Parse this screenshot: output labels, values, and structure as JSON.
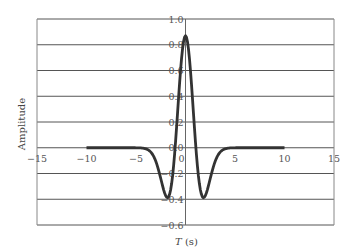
{
  "chart_data": {
    "type": "line",
    "title": "",
    "xlabel": "T (s)",
    "ylabel": "Amplitude",
    "xlim": [
      -15,
      15
    ],
    "ylim": [
      -0.6,
      1.0
    ],
    "grid": {
      "horizontal": true,
      "vertical": false
    },
    "legend": "none",
    "x_ticks": [
      "-15",
      "-10",
      "-5",
      "0",
      "5",
      "10",
      "15"
    ],
    "y_ticks": [
      "1.0",
      "0.8",
      "0.6",
      "0.4",
      "0.2",
      "0.0",
      "-0.2",
      "-0.4",
      "-0.6"
    ],
    "series": [
      {
        "name": "wavelet",
        "color": "#333333",
        "x": [
          -10,
          -6,
          -5,
          -4,
          -3.5,
          -3,
          -2.5,
          -2,
          -1.8,
          -1.5,
          -1,
          -0.5,
          0,
          0.5,
          1,
          1.5,
          1.8,
          2,
          2.5,
          3,
          3.5,
          4,
          5,
          6,
          10
        ],
        "y": [
          0,
          0,
          0,
          -0.01,
          -0.03,
          -0.1,
          -0.24,
          -0.36,
          -0.38,
          -0.34,
          -0.05,
          0.55,
          0.87,
          0.55,
          -0.05,
          -0.34,
          -0.38,
          -0.36,
          -0.24,
          -0.1,
          -0.03,
          -0.01,
          0,
          0,
          0
        ]
      }
    ]
  }
}
